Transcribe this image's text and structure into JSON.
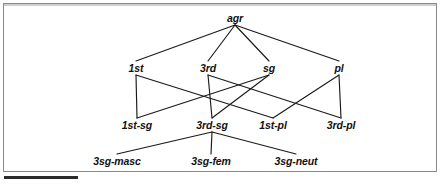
{
  "figure": {
    "diagram_type": "type-lattice",
    "background_color": "#ffffff",
    "line_color": "#1a1a1a",
    "text_color": "#111111",
    "border_color": "#8a8a8a"
  },
  "nodes": [
    {
      "id": "agr",
      "label": "agr",
      "x": 235,
      "y": 18,
      "level": 0
    },
    {
      "id": "1st",
      "label": "1st",
      "x": 136,
      "y": 68,
      "level": 1
    },
    {
      "id": "3rd",
      "label": "3rd",
      "x": 208,
      "y": 68,
      "level": 1
    },
    {
      "id": "sg",
      "label": "sg",
      "x": 269,
      "y": 68,
      "level": 1
    },
    {
      "id": "pl",
      "label": "pl",
      "x": 339,
      "y": 68,
      "level": 1
    },
    {
      "id": "1st-sg",
      "label": "1st-sg",
      "x": 137,
      "y": 125,
      "level": 2
    },
    {
      "id": "3rd-sg",
      "label": "3rd-sg",
      "x": 212,
      "y": 125,
      "level": 2
    },
    {
      "id": "1st-pl",
      "label": "1st-pl",
      "x": 273,
      "y": 125,
      "level": 2
    },
    {
      "id": "3rd-pl",
      "label": "3rd-pl",
      "x": 341,
      "y": 125,
      "level": 2
    },
    {
      "id": "3sg-masc",
      "label": "3sg-masc",
      "x": 117,
      "y": 161,
      "level": 3
    },
    {
      "id": "3sg-fem",
      "label": "3sg-fem",
      "x": 211,
      "y": 161,
      "level": 3
    },
    {
      "id": "3sg-neut",
      "label": "3sg-neut",
      "x": 296,
      "y": 161,
      "level": 3
    }
  ],
  "edges": [
    {
      "from": "agr",
      "to": "1st"
    },
    {
      "from": "agr",
      "to": "3rd"
    },
    {
      "from": "agr",
      "to": "sg"
    },
    {
      "from": "agr",
      "to": "pl"
    },
    {
      "from": "1st",
      "to": "1st-sg"
    },
    {
      "from": "1st",
      "to": "1st-pl"
    },
    {
      "from": "3rd",
      "to": "3rd-sg"
    },
    {
      "from": "3rd",
      "to": "3rd-pl"
    },
    {
      "from": "sg",
      "to": "1st-sg"
    },
    {
      "from": "sg",
      "to": "3rd-sg"
    },
    {
      "from": "pl",
      "to": "1st-pl"
    },
    {
      "from": "pl",
      "to": "3rd-pl"
    },
    {
      "from": "3rd-sg",
      "to": "3sg-masc"
    },
    {
      "from": "3rd-sg",
      "to": "3sg-fem"
    },
    {
      "from": "3rd-sg",
      "to": "3sg-neut"
    }
  ]
}
